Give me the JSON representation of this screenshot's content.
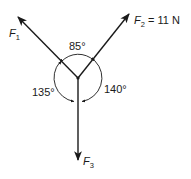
{
  "diagram": {
    "center": {
      "x": 78,
      "y": 78
    },
    "forces": [
      {
        "id": "F1",
        "label": "F",
        "subscript": "1",
        "suffix": "",
        "tip": {
          "x": 18,
          "y": 17
        }
      },
      {
        "id": "F2",
        "label": "F",
        "subscript": "2",
        "suffix": " = 11 N",
        "tip": {
          "x": 129,
          "y": 14
        }
      },
      {
        "id": "F3",
        "label": "F",
        "subscript": "3",
        "suffix": "",
        "tip": {
          "x": 78,
          "y": 160
        }
      }
    ],
    "angles": [
      {
        "between": "F1-F2",
        "label": "85°"
      },
      {
        "between": "F1-F3",
        "label": "135°"
      },
      {
        "between": "F2-F3",
        "label": "140°"
      }
    ],
    "colors": {
      "stroke": "#1a1a1a",
      "background": "#ffffff"
    }
  }
}
